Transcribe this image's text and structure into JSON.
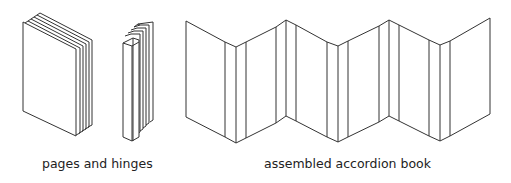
{
  "figures": [
    {
      "id": "pages-and-hinges",
      "label": "pages and hinges"
    },
    {
      "id": "assembled-accordion-book",
      "label": "assembled accordion book"
    }
  ],
  "colors": {
    "stroke": "#333333",
    "background": "#ffffff",
    "text": "#222222"
  }
}
